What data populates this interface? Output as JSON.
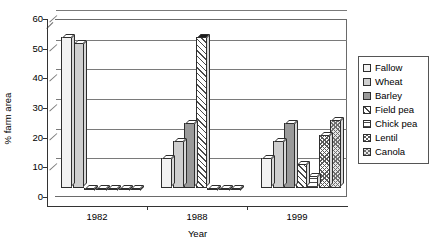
{
  "chart_data": {
    "type": "bar",
    "title": "",
    "xlabel": "Year",
    "ylabel": "% farm area",
    "categories": [
      "1982",
      "1988",
      "1999"
    ],
    "ylim": [
      0,
      60
    ],
    "yticks": [
      0,
      10,
      20,
      30,
      40,
      50,
      60
    ],
    "grid": true,
    "legend_position": "right",
    "series": [
      {
        "name": "Fallow",
        "values": [
          51,
          10,
          10
        ]
      },
      {
        "name": "Wheat",
        "values": [
          49,
          16,
          16
        ]
      },
      {
        "name": "Barley",
        "values": [
          0,
          22,
          22
        ]
      },
      {
        "name": "Field pea",
        "values": [
          0,
          51,
          8
        ]
      },
      {
        "name": "Chick pea",
        "values": [
          0,
          0,
          4
        ]
      },
      {
        "name": "Lentil",
        "values": [
          0,
          0,
          18
        ]
      },
      {
        "name": "Canola",
        "values": [
          0,
          0,
          23
        ]
      }
    ]
  },
  "axes": {
    "y_title": "% farm area",
    "x_title": "Year",
    "y_tick_labels": [
      "0",
      "10",
      "20",
      "30",
      "40",
      "50",
      "60"
    ],
    "x_tick_labels": [
      "1982",
      "1988",
      "1999"
    ]
  },
  "legend": {
    "items": [
      {
        "label": "Fallow",
        "pattern": "light-gray-solid"
      },
      {
        "label": "Wheat",
        "pattern": "medium-gray-solid"
      },
      {
        "label": "Barley",
        "pattern": "dark-gray-solid"
      },
      {
        "label": "Field pea",
        "pattern": "diagonal-hatch"
      },
      {
        "label": "Chick pea",
        "pattern": "horizontal-hatch"
      },
      {
        "label": "Lentil",
        "pattern": "cross-hatch"
      },
      {
        "label": "Canola",
        "pattern": "fine-checker"
      }
    ]
  }
}
